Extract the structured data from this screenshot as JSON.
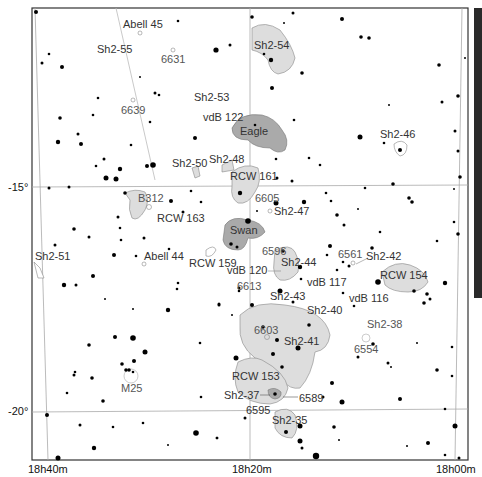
{
  "map": {
    "title": "Star chart: Sagittarius / Serpens region",
    "ra_labels": [
      {
        "text": "18h40m",
        "x": 48
      },
      {
        "text": "18h20m",
        "x": 252
      },
      {
        "text": "18h00m",
        "x": 455
      }
    ],
    "dec_labels": [
      {
        "text": "-15°",
        "y": 187
      },
      {
        "text": "-20°",
        "y": 411
      }
    ],
    "grid_color": "#999999",
    "nebula_fill_light": "#dddddd",
    "nebula_fill_dark": "#aaaaaa",
    "labels": {
      "abell45": "Abell 45",
      "sh2_55": "Sh2-55",
      "n6631": "6631",
      "sh2_54": "Sh2-54",
      "n6639": "6639",
      "sh2_53": "Sh2-53",
      "vdb122": "vdB 122",
      "eagle": "Eagle",
      "sh2_46": "Sh2-46",
      "sh2_50": "Sh2-50",
      "sh2_48": "Sh2-48",
      "rcw161": "RCW 161",
      "b312": "B312",
      "n6605": "6605",
      "rcw163": "RCW 163",
      "sh2_47": "Sh2-47",
      "swan": "Swan",
      "n6596": "6596",
      "n6561": "6561",
      "sh2_42": "Sh2-42",
      "sh2_51": "Sh2-51",
      "abell44": "Abell 44",
      "rcw159": "RCW 159",
      "sh2_44": "Sh2-44",
      "vdb120": "vdB 120",
      "rcw154": "RCW 154",
      "n6613": "6613",
      "vdb117": "vdB 117",
      "sh2_43": "Sh2-43",
      "vdb116": "vdB 116",
      "sh2_40": "Sh2-40",
      "sh2_38": "Sh2-38",
      "n6603": "6603",
      "sh2_41": "Sh2-41",
      "n6554": "6554",
      "m25": "M25",
      "rcw153": "RCW 153",
      "sh2_37": "Sh2-37",
      "n6589": "6589",
      "n6595": "6595",
      "sh2_35": "Sh2-35"
    }
  }
}
